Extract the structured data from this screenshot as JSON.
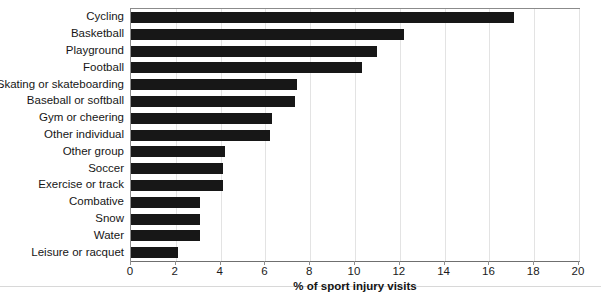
{
  "chart_data": {
    "type": "bar",
    "orientation": "horizontal",
    "title": "",
    "xlabel": "% of sport injury visits",
    "ylabel": "",
    "xlim": [
      0,
      20
    ],
    "xticks": [
      0,
      2,
      4,
      6,
      8,
      10,
      12,
      14,
      16,
      18,
      20
    ],
    "grid": true,
    "legend": false,
    "categories": [
      "Cycling",
      "Basketball",
      "Playground",
      "Football",
      "Skating or skateboarding",
      "Baseball or softball",
      "Gym or cheering",
      "Other individual",
      "Other group",
      "Soccer",
      "Exercise or track",
      "Combative",
      "Snow",
      "Water",
      "Leisure or racquet"
    ],
    "values": [
      17.1,
      12.2,
      11.0,
      10.3,
      7.4,
      7.3,
      6.3,
      6.2,
      4.2,
      4.1,
      4.1,
      3.1,
      3.1,
      3.1,
      2.1
    ],
    "bar_color": "#171717",
    "grid_color": "#e3e3e3",
    "axis_color": "#8b8b8b"
  }
}
